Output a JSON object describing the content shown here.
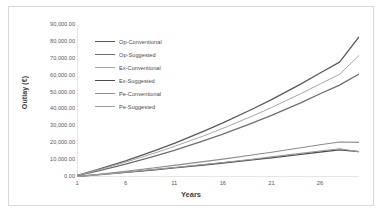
{
  "chart_data": {
    "type": "line",
    "title": "",
    "xlabel": "Years",
    "ylabel": "Outlay (€)",
    "xlim": [
      1,
      30
    ],
    "ylim": [
      0,
      90000
    ],
    "grid": false,
    "legend_position": "inside-top-left",
    "x_ticks": [
      "1",
      "6",
      "11",
      "16",
      "21",
      "26"
    ],
    "x_tick_values": [
      1,
      6,
      11,
      16,
      21,
      26
    ],
    "y_ticks": [
      "0.00",
      "10,000.00",
      "20,000.00",
      "30,000.00",
      "40,000.00",
      "50,000.00",
      "60,000.00",
      "70,000.00",
      "80,000.00",
      "90,000.00"
    ],
    "y_tick_values": [
      0,
      10000,
      20000,
      30000,
      40000,
      50000,
      60000,
      70000,
      80000,
      90000
    ],
    "x": [
      1,
      3,
      6,
      9,
      11,
      14,
      16,
      19,
      21,
      24,
      26,
      28,
      30
    ],
    "series": [
      {
        "name": "Op-Conventional",
        "color": "#595959",
        "width": 1.3,
        "values": [
          900,
          4200,
          9600,
          15600,
          19900,
          27000,
          32000,
          40100,
          45800,
          55000,
          61600,
          68000,
          83000
        ]
      },
      {
        "name": "Op-Suggested",
        "color": "#6e6e6e",
        "width": 1.3,
        "values": [
          800,
          3400,
          7600,
          12300,
          15700,
          21400,
          25400,
          31900,
          36500,
          43900,
          49300,
          54400,
          61000
        ]
      },
      {
        "name": "Ex-Conventional",
        "color": "#a6a6a6",
        "width": 1.0,
        "values": [
          850,
          3900,
          8800,
          14200,
          18100,
          24300,
          28800,
          36000,
          41100,
          49300,
          55100,
          60800,
          72000
        ]
      },
      {
        "name": "Ex-Suggested",
        "color": "#4d4d4d",
        "width": 1.3,
        "values": [
          300,
          1200,
          2700,
          4300,
          5400,
          7100,
          8300,
          10100,
          11400,
          13400,
          14800,
          16100,
          15000
        ]
      },
      {
        "name": "Pe-Conventional",
        "color": "#8c8c8c",
        "width": 1.1,
        "values": [
          350,
          1500,
          3400,
          5500,
          6900,
          9100,
          10600,
          13000,
          14700,
          17300,
          19100,
          20700,
          20500
        ]
      },
      {
        "name": "Pe-Suggested",
        "color": "#9c9c9c",
        "width": 1.1,
        "values": [
          300,
          1250,
          2800,
          4500,
          5600,
          7400,
          8600,
          10500,
          11900,
          14000,
          15400,
          16700,
          15000
        ]
      }
    ],
    "legend_entries": [
      {
        "label": "Op-Conventional",
        "color": "#595959",
        "width": 1.6
      },
      {
        "label": "Op-Suggested",
        "color": "#6e6e6e",
        "width": 1.6
      },
      {
        "label": "Ex-Conventional",
        "color": "#a6a6a6",
        "width": 1.0
      },
      {
        "label": "Ex-Suggested",
        "color": "#4d4d4d",
        "width": 1.6
      },
      {
        "label": "Pe-Conventional",
        "color": "#8c8c8c",
        "width": 1.2
      },
      {
        "label": "Pe-Suggested",
        "color": "#9c9c9c",
        "width": 1.2
      }
    ],
    "axis_color": "#bfbfbf",
    "frame_color": "#d9d9d9",
    "tick_text_color": "#5a5a5a"
  }
}
